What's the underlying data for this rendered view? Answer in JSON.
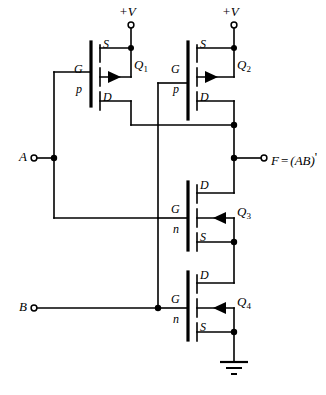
{
  "figure": {
    "kind": "cmos-nand-gate-schematic",
    "output_expression": "F = (AB)'",
    "supply_label": "+V",
    "ground_symbol": "earth-ground"
  },
  "inputs": [
    {
      "name": "A",
      "label": "A",
      "drives": [
        "Q1",
        "Q3"
      ]
    },
    {
      "name": "B",
      "label": "B",
      "drives": [
        "Q2",
        "Q4"
      ]
    }
  ],
  "output": {
    "label_f": "F",
    "label_eq": "=",
    "label_expr": "(AB)",
    "label_prime": "'",
    "full": "F = (AB)'"
  },
  "supplies": [
    {
      "id": "vdd-left",
      "label": "+V"
    },
    {
      "id": "vdd-right",
      "label": "+V"
    }
  ],
  "transistors": [
    {
      "id": "Q1",
      "label": "Q",
      "index": "1",
      "channel": "p",
      "channel_label": "p",
      "gate_label": "G",
      "top_pin": "S",
      "bottom_pin": "D",
      "arrow_direction": "right",
      "gate_input": "A"
    },
    {
      "id": "Q2",
      "label": "Q",
      "index": "2",
      "channel": "p",
      "channel_label": "p",
      "gate_label": "G",
      "top_pin": "S",
      "bottom_pin": "D",
      "arrow_direction": "right",
      "gate_input": "B"
    },
    {
      "id": "Q3",
      "label": "Q",
      "index": "3",
      "channel": "n",
      "channel_label": "n",
      "gate_label": "G",
      "top_pin": "D",
      "bottom_pin": "S",
      "arrow_direction": "left",
      "gate_input": "A"
    },
    {
      "id": "Q4",
      "label": "Q",
      "index": "4",
      "channel": "n",
      "channel_label": "n",
      "gate_label": "G",
      "top_pin": "D",
      "bottom_pin": "S",
      "arrow_direction": "left",
      "gate_input": "B"
    }
  ],
  "colors": {
    "wire": "#000000",
    "background": "#ffffff",
    "text": "#000000"
  }
}
